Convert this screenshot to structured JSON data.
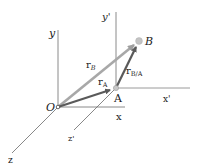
{
  "diagram": {
    "axes": {
      "fixed": {
        "x": "x",
        "y": "y",
        "z": "z",
        "origin": "O"
      },
      "translating": {
        "x": "x'",
        "y": "y'",
        "z": "z'",
        "origin": "A"
      }
    },
    "points": {
      "O": "O",
      "A": "A",
      "B": "B"
    },
    "vectors": {
      "r_B": {
        "base": "r",
        "sub": "B"
      },
      "r_A": {
        "base": "r",
        "sub": "A"
      },
      "r_BA": {
        "base": "r",
        "sub": "B/A"
      }
    },
    "colors": {
      "axis": "#8a8a8a",
      "r_B": "#a8a8a8",
      "r_A": "#5a5a5a",
      "r_BA": "#5a5a5a",
      "point": "#bdbdbd"
    }
  }
}
